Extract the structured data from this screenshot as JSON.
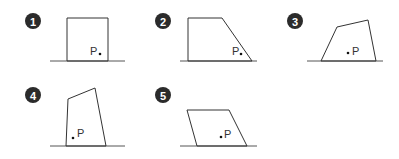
{
  "figures": [
    {
      "number": "1",
      "shape": "rectangle",
      "point_label": "P"
    },
    {
      "number": "2",
      "shape": "right-trapezoid",
      "point_label": "P"
    },
    {
      "number": "3",
      "shape": "irregular-quadrilateral",
      "point_label": "P"
    },
    {
      "number": "4",
      "shape": "tall-quadrilateral",
      "point_label": "P"
    },
    {
      "number": "5",
      "shape": "parallelogram",
      "point_label": "P"
    }
  ]
}
